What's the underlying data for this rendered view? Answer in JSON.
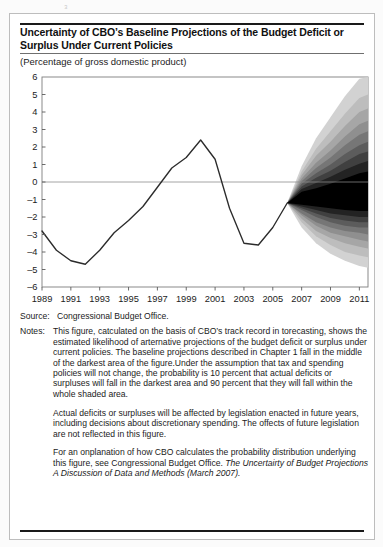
{
  "figure": {
    "title": "Uncertainty of CBO’s Baseline Projections of the Budget Deficit or Surplus Under Current Policies",
    "subtitle": "(Percentage of gross domestic product)",
    "source_label": "Source:",
    "source_text": "Congressional Budget Office.",
    "notes_label": "Notes:",
    "notes_paragraphs": [
      "This figure, catculated on the basis of CBO’s track record in torecasting, shows the estimated likelihood of arternative projections of the budget deficit or surplus under current policies. The baseline projections described in Chapter 1 fall in the middle of the darkest area of the figure.Under the assumption that tax and spending policies will not change, the probability is 10 percent that actual deficits or surpluses will fall in the darkest area and 90 percent that they will fall within the whole shaded area.",
      "Actual deficits or surpluses will be affected by legislation enacted in future years, including decisions about discretionary spending. The offects of future legislation are not reflected in this figure.",
      "For an onplanation of how CBO calculates the probability distribution underlying this figure, see Congressional Budget Office."
    ],
    "notes_italic_tail": "The Uncertairty of Budget Projections A Discussion of Data and Methods (March 2007).",
    "colors": {
      "rule": "#1a1a1a",
      "axis": "#5a5a5a",
      "zero_line": "#8a8a8a",
      "data_line": "#2b2b2b",
      "fan_darkest": "#000000",
      "fan_lightest": "#d2d2d2",
      "background": "#ffffff"
    }
  },
  "chart_data": {
    "type": "area",
    "title": "Uncertainty of CBO’s Baseline Projections of the Budget Deficit or Surplus Under Current Policies",
    "subtitle": "(Percentage of gross domestic product)",
    "xlabel": "",
    "ylabel": "Percentage of gross domestic product",
    "xlim": [
      1989,
      2011.6
    ],
    "ylim": [
      -6,
      6
    ],
    "yticks": [
      6,
      5,
      4,
      3,
      2,
      1,
      0,
      -1,
      -2,
      -3,
      -4,
      -5,
      -6
    ],
    "ytick_labels": [
      "6",
      "5",
      "4",
      "3",
      "2",
      "1",
      "0",
      "–1",
      "–2",
      "–3",
      "–4",
      "–5",
      "–6"
    ],
    "xticks": [
      1989,
      1991,
      1993,
      1995,
      1997,
      1999,
      2001,
      2003,
      2005,
      2007,
      2009,
      2011
    ],
    "xtick_labels": [
      "1989",
      "1991",
      "1993",
      "1995",
      "1997",
      "1999",
      "2001",
      "2003",
      "2005",
      "2007",
      "2009",
      "2011"
    ],
    "grid": false,
    "zero_line": 0,
    "legend": null,
    "series": [
      {
        "name": "Actual and projected deficit or surplus",
        "type": "line",
        "x": [
          1989,
          1990,
          1991,
          1992,
          1993,
          1994,
          1995,
          1996,
          1997,
          1998,
          1999,
          2000,
          2001,
          2002,
          2003,
          2004,
          2005,
          2006
        ],
        "values": [
          -2.8,
          -3.9,
          -4.5,
          -4.7,
          -3.9,
          -2.9,
          -2.2,
          -1.4,
          -0.3,
          0.8,
          1.4,
          2.4,
          1.3,
          -1.5,
          -3.5,
          -3.6,
          -2.6,
          -1.2
        ]
      }
    ],
    "fan": {
      "description": "Probability fan of alternative projections, 2006–2011; darkest band = 10 percent likelihood, whole shaded area = 90 percent likelihood.",
      "origin_year": 2006,
      "origin_value": -1.2,
      "x": [
        2006,
        2007,
        2008,
        2009,
        2010,
        2011,
        2011.6
      ],
      "bands": [
        {
          "level": "90 percent (whole shaded area)",
          "shade": "#d2d2d2",
          "upper": [
            -1.2,
            0.9,
            2.5,
            3.7,
            4.9,
            5.9,
            6.0
          ],
          "lower": [
            -1.2,
            -2.6,
            -3.5,
            -4.1,
            -4.5,
            -4.8,
            -4.9
          ]
        },
        {
          "level": "80 percent",
          "shade": "#bdbdbd",
          "upper": [
            -1.2,
            0.6,
            1.9,
            2.9,
            3.9,
            4.8,
            5.0
          ],
          "lower": [
            -1.2,
            -2.3,
            -3.1,
            -3.6,
            -4.0,
            -4.2,
            -4.3
          ]
        },
        {
          "level": "70 percent",
          "shade": "#a6a6a6",
          "upper": [
            -1.2,
            0.4,
            1.5,
            2.3,
            3.2,
            4.0,
            4.2
          ],
          "lower": [
            -1.2,
            -2.1,
            -2.8,
            -3.2,
            -3.5,
            -3.7,
            -3.8
          ]
        },
        {
          "level": "60 percent",
          "shade": "#8f8f8f",
          "upper": [
            -1.2,
            0.2,
            1.1,
            1.8,
            2.6,
            3.3,
            3.5
          ],
          "lower": [
            -1.2,
            -1.9,
            -2.5,
            -2.9,
            -3.1,
            -3.3,
            -3.4
          ]
        },
        {
          "level": "50 percent",
          "shade": "#767676",
          "upper": [
            -1.2,
            0.05,
            0.8,
            1.4,
            2.1,
            2.7,
            2.9
          ],
          "lower": [
            -1.2,
            -1.8,
            -2.3,
            -2.6,
            -2.8,
            -2.9,
            -3.0
          ]
        },
        {
          "level": "40 percent",
          "shade": "#5c5c5c",
          "upper": [
            -1.2,
            -0.1,
            0.5,
            1.0,
            1.6,
            2.1,
            2.3
          ],
          "lower": [
            -1.2,
            -1.6,
            -2.0,
            -2.3,
            -2.5,
            -2.6,
            -2.6
          ]
        },
        {
          "level": "30 percent",
          "shade": "#404040",
          "upper": [
            -1.2,
            -0.25,
            0.25,
            0.65,
            1.15,
            1.6,
            1.75
          ],
          "lower": [
            -1.2,
            -1.5,
            -1.8,
            -2.05,
            -2.2,
            -2.3,
            -2.3
          ]
        },
        {
          "level": "20 percent",
          "shade": "#232323",
          "upper": [
            -1.2,
            -0.4,
            -0.05,
            0.3,
            0.7,
            1.05,
            1.2
          ],
          "lower": [
            -1.2,
            -1.4,
            -1.6,
            -1.8,
            -1.9,
            -2.0,
            -2.0
          ]
        },
        {
          "level": "10 percent (darkest area)",
          "shade": "#000000",
          "upper": [
            -1.2,
            -0.55,
            -0.35,
            -0.1,
            0.2,
            0.5,
            0.6
          ],
          "lower": [
            -1.2,
            -1.3,
            -1.4,
            -1.5,
            -1.6,
            -1.65,
            -1.65
          ]
        }
      ]
    }
  }
}
